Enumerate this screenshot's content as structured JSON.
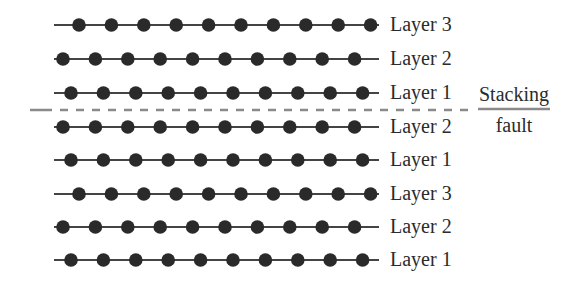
{
  "diagram": {
    "title": "",
    "colors": {
      "atom": "#2a2a2a",
      "bond": "#444444",
      "fault_line": "#8a8a8a",
      "text": "#2b2b2b"
    },
    "geometry": {
      "line_start_x": 54,
      "line_end_x": 379,
      "dot_spacing": 32.4,
      "dot_radius": 6.8,
      "dots_per_row": 10,
      "label_x": 390,
      "position_offsets": {
        "A": 63,
        "B": 79,
        "C": 71
      }
    },
    "rows": [
      {
        "label": "Layer 3",
        "y": 25,
        "position": "B"
      },
      {
        "label": "Layer 2",
        "y": 59,
        "position": "A"
      },
      {
        "label": "Layer 1",
        "y": 93,
        "position": "C"
      },
      {
        "label": "Layer 2",
        "y": 127,
        "position": "A"
      },
      {
        "label": "Layer 1",
        "y": 160,
        "position": "C"
      },
      {
        "label": "Layer 3",
        "y": 194,
        "position": "B"
      },
      {
        "label": "Layer 2",
        "y": 227,
        "position": "A"
      },
      {
        "label": "Layer 1",
        "y": 260,
        "position": "C"
      }
    ],
    "stacking_fault": {
      "line_y": 110,
      "line_start_x": 30,
      "line_end_x": 470,
      "label_top": "Stacking",
      "label_bottom": "fault",
      "label_center_x": 514,
      "divider_start_x": 478,
      "divider_end_x": 550
    }
  }
}
